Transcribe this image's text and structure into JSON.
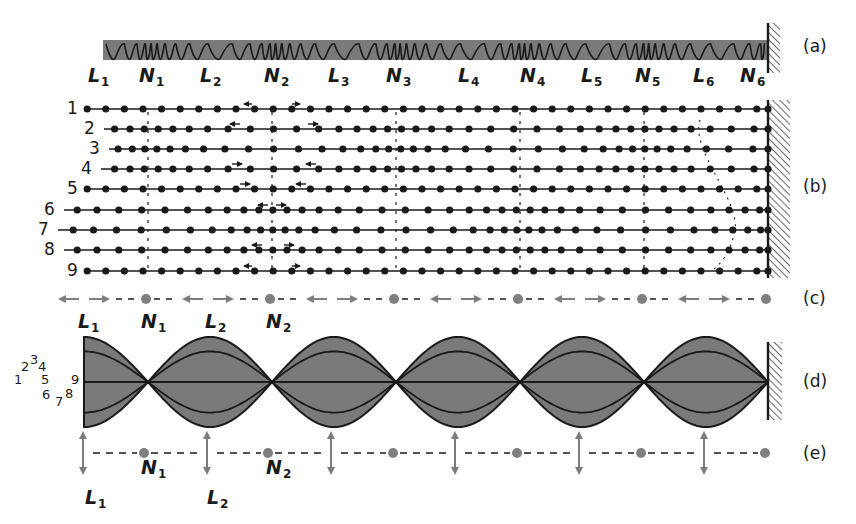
{
  "figure": {
    "colors": {
      "ink": "#1a1a1a",
      "fill_gray": "#7a7a7a",
      "arrow_gray": "#7d7d7d",
      "node_gray": "#808080"
    }
  },
  "panel_a": {
    "tag": "(a)",
    "labels": [
      {
        "letter": "L",
        "sub": "1",
        "x": 88
      },
      {
        "letter": "N",
        "sub": "1",
        "x": 139
      },
      {
        "letter": "L",
        "sub": "2",
        "x": 200
      },
      {
        "letter": "N",
        "sub": "2",
        "x": 264
      },
      {
        "letter": "L",
        "sub": "3",
        "x": 328
      },
      {
        "letter": "N",
        "sub": "3",
        "x": 386
      },
      {
        "letter": "L",
        "sub": "4",
        "x": 458
      },
      {
        "letter": "N",
        "sub": "4",
        "x": 520
      },
      {
        "letter": "L",
        "sub": "5",
        "x": 581
      },
      {
        "letter": "N",
        "sub": "5",
        "x": 635
      },
      {
        "letter": "L",
        "sub": "6",
        "x": 693
      },
      {
        "letter": "N",
        "sub": "6",
        "x": 740
      }
    ]
  },
  "panel_b": {
    "tag": "(b)",
    "rows": [
      {
        "num": "1",
        "y": 109,
        "start": 87
      },
      {
        "num": "2",
        "y": 129,
        "start": 104
      },
      {
        "num": "3",
        "y": 149,
        "start": 109
      },
      {
        "num": "4",
        "y": 169,
        "start": 101
      },
      {
        "num": "5",
        "y": 189,
        "start": 87
      },
      {
        "num": "6",
        "y": 210,
        "start": 64
      },
      {
        "num": "7",
        "y": 230,
        "start": 58
      },
      {
        "num": "8",
        "y": 250,
        "start": 64
      },
      {
        "num": "9",
        "y": 271,
        "start": 87
      }
    ]
  },
  "panel_c": {
    "tag": "(c)",
    "labels": [
      {
        "letter": "L",
        "sub": "1",
        "x": 78
      },
      {
        "letter": "N",
        "sub": "1",
        "x": 141
      },
      {
        "letter": "L",
        "sub": "2",
        "x": 205
      },
      {
        "letter": "N",
        "sub": "2",
        "x": 266
      }
    ]
  },
  "panel_d": {
    "tag": "(d)",
    "curve_labels": [
      {
        "text": "1",
        "x": 14,
        "y": 381
      },
      {
        "text": "2",
        "x": 21,
        "y": 368
      },
      {
        "text": "3",
        "x": 30,
        "y": 361
      },
      {
        "text": "4",
        "x": 38,
        "y": 368
      },
      {
        "text": "5",
        "x": 41,
        "y": 381
      },
      {
        "text": "9",
        "x": 71,
        "y": 381
      },
      {
        "text": "6",
        "x": 42,
        "y": 396
      },
      {
        "text": "7",
        "x": 55,
        "y": 403
      },
      {
        "text": "8",
        "x": 65,
        "y": 395
      }
    ]
  },
  "panel_e": {
    "tag": "(e)",
    "labels": [
      {
        "letter": "N",
        "sub": "1",
        "x": 141,
        "y": 458
      },
      {
        "letter": "N",
        "sub": "2",
        "x": 266,
        "y": 458
      },
      {
        "letter": "L",
        "sub": "1",
        "x": 85,
        "y": 488
      },
      {
        "letter": "L",
        "sub": "2",
        "x": 207,
        "y": 488
      }
    ]
  }
}
